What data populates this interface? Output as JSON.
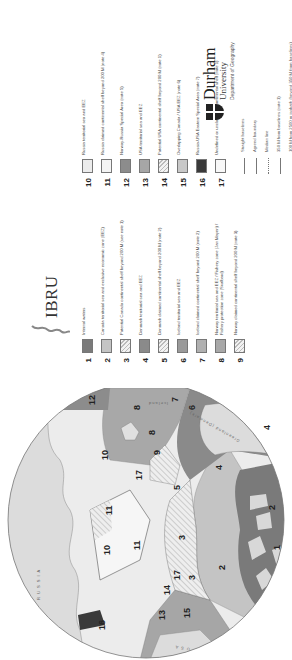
{
  "map": {
    "region_labels": [
      {
        "num": "1"
      },
      {
        "num": "2"
      },
      {
        "num": "2"
      },
      {
        "num": "3"
      },
      {
        "num": "3"
      },
      {
        "num": "4"
      },
      {
        "num": "4"
      },
      {
        "num": "5"
      },
      {
        "num": "6"
      },
      {
        "num": "7"
      },
      {
        "num": "8"
      },
      {
        "num": "8"
      },
      {
        "num": "9"
      },
      {
        "num": "10"
      },
      {
        "num": "10"
      },
      {
        "num": "11"
      },
      {
        "num": "11"
      },
      {
        "num": "12"
      },
      {
        "num": "13"
      },
      {
        "num": "14"
      },
      {
        "num": "15"
      },
      {
        "num": "16"
      },
      {
        "num": "17"
      },
      {
        "num": "17"
      }
    ],
    "place_names": {
      "russia": "R U S S I A",
      "usa": "U S A",
      "greenland": "Greenland (Denmark)",
      "iceland": "Iceland"
    }
  },
  "logos": {
    "ibru": "IBRU",
    "durham_name": "Durham",
    "durham_university": "University",
    "durham_department": "Department of Geography"
  },
  "legend": {
    "items": [
      {
        "num": "1",
        "text": "Internal waters",
        "color": "#7a7a7a",
        "hatched": false
      },
      {
        "num": "2",
        "text": "Canada territorial sea and exclusive economic zone (EEZ)",
        "color": "#c4c4c4",
        "hatched": false
      },
      {
        "num": "3",
        "text": "Potential Canada continental shelf beyond 200 M (see note 1)",
        "color": "#e6e6e6",
        "hatched": true
      },
      {
        "num": "4",
        "text": "Denmark territorial sea and EEZ",
        "color": "#8a8a8a",
        "hatched": false
      },
      {
        "num": "5",
        "text": "Denmark claimed continental shelf beyond 200 M (note 2)",
        "color": "#d8d8d8",
        "hatched": true
      },
      {
        "num": "6",
        "text": "Iceland territorial sea and EEZ",
        "color": "#9a9a9a",
        "hatched": false
      },
      {
        "num": "7",
        "text": "Iceland claimed continental shelf beyond 200 M (note 2)",
        "color": "#b0b0b0",
        "hatched": false
      },
      {
        "num": "8",
        "text": "Norway territorial sea and EEZ / Fishery zone (Jan Mayen) / Fishery protection zone (Svalbard)",
        "color": "#a8a8a8",
        "hatched": false
      },
      {
        "num": "9",
        "text": "Norway claimed continental shelf beyond 200 M (note 3)",
        "color": "#d0d0d0",
        "hatched": true
      },
      {
        "num": "10",
        "text": "Russia territorial sea and EEZ",
        "color": "#ececec",
        "hatched": false
      },
      {
        "num": "11",
        "text": "Russia claimed continental shelf beyond 200 M (note 4)",
        "color": "#f4f4f4",
        "hatched": false
      },
      {
        "num": "12",
        "text": "Norway-Russia Special Area (note 5)",
        "color": "#8c8c8c",
        "hatched": false
      },
      {
        "num": "13",
        "text": "USA territorial sea and EEZ",
        "color": "#a6a6a6",
        "hatched": false
      },
      {
        "num": "14",
        "text": "Potential USA continental shelf beyond 200 M (note 1)",
        "color": "#e8e8e8",
        "hatched": true
      },
      {
        "num": "15",
        "text": "Overlapping Canada / USA EEZ (note 6)",
        "color": "#c8c8c8",
        "hatched": false
      },
      {
        "num": "16",
        "text": "Russia-USA Eastern Special Area (note 7)",
        "color": "#3a3a3a",
        "hatched": false
      },
      {
        "num": "17",
        "text": "Undefined or unclaimable continental shelf (note 1)",
        "color": "#f8f8f8",
        "hatched": false
      }
    ],
    "lines": [
      {
        "text": "Straight baselines",
        "style": "solid"
      },
      {
        "text": "Agreed boundary",
        "style": "solid"
      },
      {
        "text": "Median line",
        "style": "dotted"
      },
      {
        "text": "350 M from baselines (note 1)",
        "style": "solid"
      },
      {
        "text": "100 M from 2500 m isobath (beyond 350 M from baselines) (note 1)",
        "style": "solid"
      },
      {
        "text": "Svalbard treaty area (note 8)",
        "style": "solid"
      },
      {
        "text": "Iceland-Norway joint zone (note 9)",
        "style": "solid"
      },
      {
        "text": "Main 'Northwest Passage' shipping routes through Canada claimed internal waters",
        "style": "thick"
      }
    ]
  }
}
